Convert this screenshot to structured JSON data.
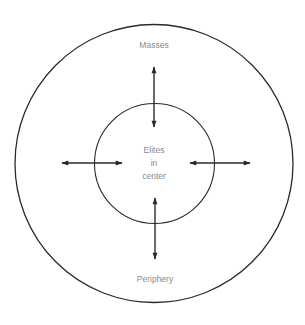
{
  "diagram": {
    "type": "core-periphery",
    "outer_label_top": "Masses",
    "outer_label_bottom": "Periphery",
    "center_label_lines": [
      "Elites",
      "in",
      "center"
    ],
    "colors": {
      "stroke": "#2a2a2a",
      "text": "#8a8a8a",
      "background": "#ffffff"
    },
    "arrows": [
      {
        "direction": "vertical",
        "position": "top",
        "double_headed": true
      },
      {
        "direction": "horizontal",
        "position": "left",
        "double_headed": true
      },
      {
        "direction": "horizontal",
        "position": "right",
        "double_headed": true
      },
      {
        "direction": "vertical",
        "position": "bottom",
        "double_headed": true
      }
    ]
  }
}
